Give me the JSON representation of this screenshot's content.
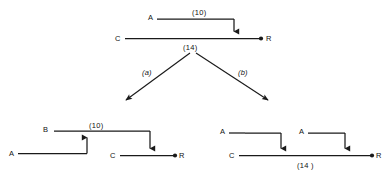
{
  "figure": {
    "title": "",
    "type": "activity-on-arrow network transformation"
  },
  "parent": {
    "name": "parent-network",
    "nodes": [
      {
        "id": "A",
        "label": "A"
      },
      {
        "id": "C",
        "label": "C"
      },
      {
        "id": "R",
        "label": "R"
      }
    ],
    "edges": [
      {
        "from": "A",
        "to": "R",
        "weight_label": "(10)"
      },
      {
        "from": "C",
        "to": "R",
        "weight_label": "(14)"
      }
    ],
    "weight_top": "(10)",
    "weight_bottom": "(14)"
  },
  "branches": [
    {
      "id": "a",
      "label": "(a)"
    },
    {
      "id": "b",
      "label": "(b)"
    }
  ],
  "child_left": {
    "name": "child-network-a",
    "nodes": [
      {
        "id": "B",
        "label": "B"
      },
      {
        "id": "A",
        "label": "A"
      },
      {
        "id": "C",
        "label": "C"
      },
      {
        "id": "R",
        "label": "R"
      }
    ],
    "weight_label": "(10)"
  },
  "child_right": {
    "name": "child-network-b",
    "nodes": [
      {
        "id": "A1",
        "label": "A"
      },
      {
        "id": "A2",
        "label": "A"
      },
      {
        "id": "C",
        "label": "C"
      },
      {
        "id": "R",
        "label": "R"
      }
    ],
    "weight_label": "(14 )"
  },
  "colors": {
    "stroke": "#1a1a1a",
    "background": "#ffffff",
    "text": "#111111"
  }
}
